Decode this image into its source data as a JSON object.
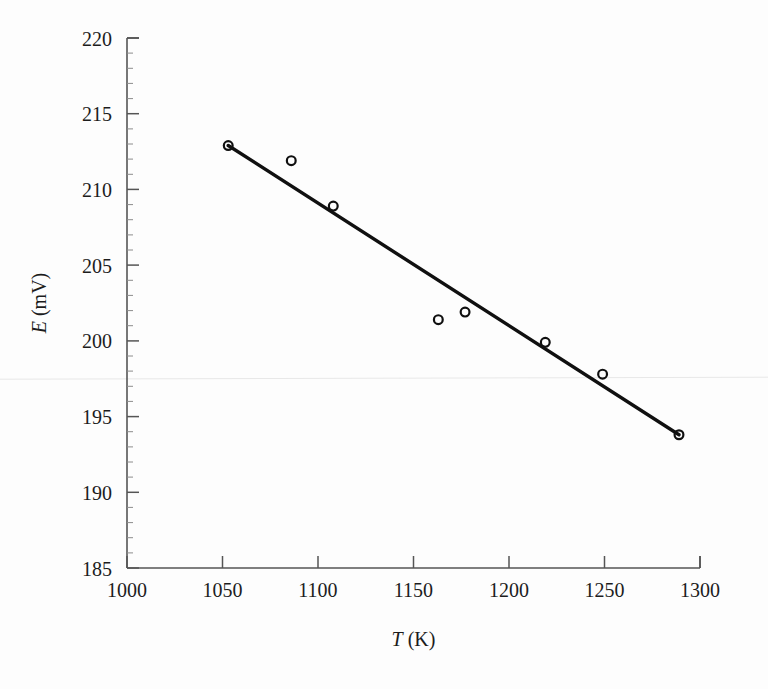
{
  "chart_data": {
    "type": "scatter",
    "title": "",
    "subtitle": "",
    "xlabel": "T (K)",
    "xlabel_italic_part": "T",
    "xlabel_rest": " (K)",
    "ylabel": "E (mV)",
    "ylabel_italic_part": "E",
    "ylabel_rest": " (mV)",
    "xlim": [
      1000,
      1300
    ],
    "ylim": [
      185,
      220
    ],
    "x_major_step": 50,
    "x_minor_step": 10,
    "y_major_step": 5,
    "y_minor_step": 1,
    "grid": false,
    "legend": null,
    "legend_position": "none",
    "x_tick_labels": [
      "1000",
      "1050",
      "1100",
      "1150",
      "1200",
      "1250",
      "1300"
    ],
    "y_tick_labels": [
      "185",
      "190",
      "195",
      "200",
      "205",
      "210",
      "215",
      "220"
    ],
    "x_ticks": [
      1000,
      1050,
      1100,
      1150,
      1200,
      1250,
      1300
    ],
    "y_ticks": [
      185,
      190,
      195,
      200,
      205,
      210,
      215,
      220
    ],
    "marker_style": "open-circle",
    "series": [
      {
        "name": "measured EMF",
        "marker": "open-circle",
        "x": [
          1053,
          1086,
          1108,
          1163,
          1177,
          1219,
          1249,
          1289
        ],
        "y": [
          212.9,
          211.9,
          208.9,
          201.4,
          201.9,
          199.9,
          197.8,
          193.8
        ]
      }
    ],
    "fit_line": {
      "name": "linear least-squares fit",
      "x": [
        1053,
        1289
      ],
      "y": [
        212.9,
        193.8
      ],
      "slope": -0.0809,
      "intercept": 298.1
    },
    "artifact": {
      "description": "faint horizontal scan line",
      "y_value": 197.5
    }
  },
  "figure": {
    "background_color": "#fdfdfd",
    "axis_color": "#555555",
    "data_color": "#101010"
  }
}
